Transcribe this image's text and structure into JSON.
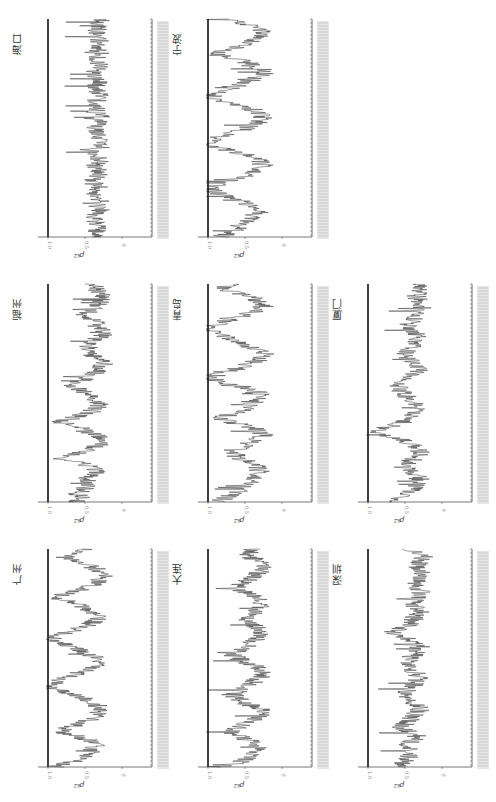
{
  "figure": {
    "orientation": "rotated-90-ccw",
    "line_color": "#1a1a1a",
    "ref_line_color": "#111111",
    "tick_label_color": "#999999"
  },
  "chart_data": [
    {
      "id": "haikou",
      "type": "line",
      "title": "海口",
      "ylabel": "ρ_k2",
      "yticks": [
        "1.0",
        "0.5",
        "0"
      ],
      "ylim": [
        0,
        1.0
      ],
      "ref_line": 1.0,
      "xlabel": "date (dense ticks, illegible)",
      "grid": false,
      "values": [
        0.4,
        0.35,
        0.3,
        0.38,
        0.32,
        0.42,
        0.3,
        0.36,
        0.3,
        0.45,
        0.33,
        0.3,
        0.38,
        0.4,
        0.3,
        0.32,
        0.36,
        0.3,
        0.34,
        0.48,
        0.3,
        0.35,
        0.3,
        0.33,
        0.4,
        0.3,
        0.34,
        0.3,
        0.36,
        0.3,
        0.38,
        0.32,
        0.3,
        0.35,
        0.34,
        0.3,
        0.4,
        0.36,
        0.3,
        0.33,
        0.35,
        0.3,
        0.32,
        0.38,
        0.3,
        0.34,
        0.36,
        0.3,
        0.33,
        0.3
      ]
    },
    {
      "id": "ningbo",
      "type": "line",
      "title": "宁波",
      "ylabel": "ρ_k2",
      "yticks": [
        "1.0",
        "0.5",
        "0"
      ],
      "ylim": [
        0,
        1.0
      ],
      "ref_line": 1.0,
      "xlabel": "date (dense ticks, illegible)",
      "grid": false,
      "values": [
        0.85,
        0.7,
        0.6,
        0.55,
        0.45,
        0.35,
        0.3,
        0.4,
        0.55,
        0.75,
        0.9,
        0.95,
        0.8,
        0.6,
        0.45,
        0.35,
        0.25,
        0.3,
        0.4,
        0.6,
        0.85,
        1.0,
        0.9,
        0.75,
        0.55,
        0.4,
        0.3,
        0.25,
        0.3,
        0.45,
        0.7,
        0.9,
        0.95,
        0.8,
        0.6,
        0.45,
        0.3,
        0.2,
        0.3,
        0.45,
        0.6,
        0.9,
        0.75,
        0.55,
        0.4,
        0.3,
        0.25,
        0.35,
        0.5,
        0.7
      ]
    },
    {
      "id": "fuzhou",
      "type": "line",
      "title": "福州",
      "ylabel": "ρ_k2",
      "yticks": [
        "1.0",
        "0.5",
        "0"
      ],
      "ylim": [
        0,
        1.0
      ],
      "ref_line": 1.0,
      "xlabel": "date (dense ticks, illegible)",
      "grid": false,
      "values": [
        0.65,
        0.55,
        0.6,
        0.5,
        0.45,
        0.5,
        0.4,
        0.35,
        0.45,
        0.6,
        0.9,
        0.6,
        0.4,
        0.3,
        0.3,
        0.35,
        0.5,
        0.6,
        0.85,
        0.65,
        0.45,
        0.35,
        0.3,
        0.35,
        0.45,
        0.5,
        0.7,
        0.6,
        0.45,
        0.35,
        0.3,
        0.25,
        0.3,
        0.4,
        0.5,
        0.45,
        0.4,
        0.3,
        0.25,
        0.3,
        0.35,
        0.4,
        0.5,
        0.45,
        0.35,
        0.3,
        0.25,
        0.3,
        0.35,
        0.4
      ]
    },
    {
      "id": "qingdao",
      "type": "line",
      "title": "青岛",
      "ylabel": "ρ_k2",
      "yticks": [
        "1.0",
        "0.5",
        "0"
      ],
      "ylim": [
        0,
        1.0
      ],
      "ref_line": 1.0,
      "xlabel": "date (dense ticks, illegible)",
      "grid": false,
      "values": [
        0.9,
        0.75,
        0.6,
        0.5,
        0.45,
        0.4,
        0.35,
        0.3,
        0.35,
        0.45,
        0.6,
        0.65,
        0.55,
        0.45,
        0.35,
        0.25,
        0.3,
        0.45,
        0.7,
        0.85,
        0.6,
        0.45,
        0.4,
        0.35,
        0.3,
        0.35,
        0.55,
        0.85,
        0.95,
        0.8,
        0.6,
        0.45,
        0.3,
        0.2,
        0.3,
        0.45,
        0.6,
        0.75,
        0.9,
        1.0,
        0.85,
        0.7,
        0.5,
        0.35,
        0.25,
        0.3,
        0.4,
        0.6,
        0.8,
        0.7
      ]
    },
    {
      "id": "xiamen",
      "type": "line",
      "title": "厦门",
      "ylabel": "ρ_k2",
      "yticks": [
        "1.0",
        "0.5",
        "0"
      ],
      "ylim": [
        0,
        1.0
      ],
      "ref_line": 1.0,
      "xlabel": "date (dense ticks, illegible)",
      "grid": false,
      "values": [
        0.7,
        0.55,
        0.45,
        0.4,
        0.35,
        0.3,
        0.35,
        0.4,
        0.55,
        0.45,
        0.35,
        0.3,
        0.3,
        0.4,
        0.55,
        0.75,
        0.9,
        0.7,
        0.5,
        0.4,
        0.35,
        0.3,
        0.35,
        0.4,
        0.5,
        0.55,
        0.6,
        0.5,
        0.4,
        0.35,
        0.3,
        0.35,
        0.45,
        0.5,
        0.45,
        0.4,
        0.35,
        0.3,
        0.35,
        0.4,
        0.45,
        0.4,
        0.35,
        0.3,
        0.25,
        0.3,
        0.35,
        0.3,
        0.3,
        0.35
      ]
    },
    {
      "id": "guangzhou",
      "type": "line",
      "title": "广州",
      "ylabel": "ρ_k2",
      "yticks": [
        "1.0",
        "0.5",
        "0"
      ],
      "ylim": [
        0,
        1.0
      ],
      "ref_line": 1.0,
      "xlabel": "date (dense ticks, illegible)",
      "grid": false,
      "values": [
        0.9,
        0.7,
        0.55,
        0.45,
        0.4,
        0.35,
        0.45,
        0.6,
        0.85,
        0.7,
        0.5,
        0.4,
        0.35,
        0.3,
        0.35,
        0.45,
        0.6,
        0.8,
        0.95,
        0.9,
        0.75,
        0.6,
        0.45,
        0.35,
        0.3,
        0.4,
        0.55,
        0.7,
        0.85,
        0.95,
        0.8,
        0.6,
        0.45,
        0.35,
        0.3,
        0.4,
        0.5,
        0.7,
        0.9,
        0.75,
        0.55,
        0.4,
        0.3,
        0.25,
        0.3,
        0.4,
        0.6,
        0.8,
        0.6,
        0.45
      ]
    },
    {
      "id": "dalian",
      "type": "line",
      "title": "大连",
      "ylabel": "ρ_k2",
      "yticks": [
        "1.0",
        "0.5",
        "0"
      ],
      "ylim": [
        0,
        1.0
      ],
      "ref_line": 1.0,
      "xlabel": "date (dense ticks, illegible)",
      "grid": false,
      "values": [
        0.8,
        0.6,
        0.45,
        0.35,
        0.3,
        0.35,
        0.45,
        0.6,
        0.7,
        0.55,
        0.45,
        0.35,
        0.25,
        0.3,
        0.45,
        0.55,
        0.65,
        0.6,
        0.5,
        0.4,
        0.3,
        0.25,
        0.3,
        0.4,
        0.55,
        0.65,
        0.6,
        0.5,
        0.4,
        0.3,
        0.25,
        0.3,
        0.4,
        0.5,
        0.45,
        0.35,
        0.3,
        0.25,
        0.3,
        0.45,
        0.6,
        0.55,
        0.45,
        0.35,
        0.3,
        0.25,
        0.3,
        0.4,
        0.45,
        0.4
      ]
    },
    {
      "id": "shenzhen",
      "type": "line",
      "title": "深圳",
      "ylabel": "ρ_k2",
      "yticks": [
        "1.0",
        "0.5",
        "0"
      ],
      "ylim": [
        0,
        1.0
      ],
      "ref_line": 1.0,
      "xlabel": "date (dense ticks, illegible)",
      "grid": false,
      "values": [
        0.6,
        0.5,
        0.45,
        0.4,
        0.45,
        0.5,
        0.4,
        0.35,
        0.45,
        0.6,
        0.45,
        0.4,
        0.35,
        0.3,
        0.35,
        0.45,
        0.55,
        0.5,
        0.4,
        0.35,
        0.3,
        0.35,
        0.4,
        0.5,
        0.45,
        0.4,
        0.35,
        0.3,
        0.35,
        0.45,
        0.65,
        0.55,
        0.45,
        0.4,
        0.35,
        0.3,
        0.35,
        0.4,
        0.35,
        0.3,
        0.3,
        0.35,
        0.3,
        0.25,
        0.3,
        0.35,
        0.3,
        0.25,
        0.3,
        0.55
      ]
    }
  ],
  "layout": {
    "panels": [
      {
        "chart": 0,
        "left": 30,
        "top": 15
      },
      {
        "chart": 1,
        "left": 190,
        "top": 15
      },
      {
        "chart": 2,
        "left": 30,
        "top": 280
      },
      {
        "chart": 3,
        "left": 190,
        "top": 280
      },
      {
        "chart": 4,
        "left": 350,
        "top": 280
      },
      {
        "chart": 5,
        "left": 30,
        "top": 545
      },
      {
        "chart": 6,
        "left": 190,
        "top": 545
      },
      {
        "chart": 7,
        "left": 350,
        "top": 545
      }
    ]
  }
}
